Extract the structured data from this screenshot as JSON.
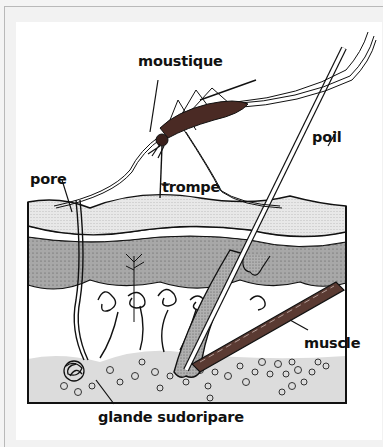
{
  "diagram": {
    "labels": {
      "mosquito": "moustique",
      "proboscis": "trompe",
      "pore": "pore",
      "hair": "poil",
      "muscle": "muscle",
      "sweat_gland": "glande sudoripare"
    },
    "colors": {
      "outline": "#111111",
      "epidermis_light": "#e4e4e4",
      "epidermis_dark": "#9a9a9a",
      "dermis_bottom": "#dcdcdc",
      "mosquito_body": "#4a2a24",
      "muscle": "#5a3a32",
      "background": "#ffffff",
      "frame": "#f2f2f2"
    }
  }
}
